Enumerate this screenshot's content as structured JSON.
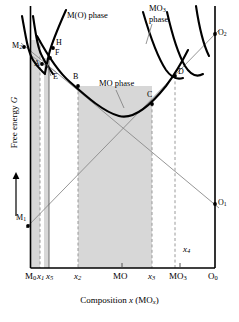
{
  "figure": {
    "type": "free-energy-composition-diagram",
    "axes": {
      "ylabel": "Free energy",
      "ylabel_symbol": "G",
      "xlabel_prefix": "Composition ",
      "xlabel_symbol": "x",
      "xlabel_suffix": " (MO",
      "xlabel_suffix_sub": "x",
      "xlabel_close": ")",
      "y_arrow": "up"
    },
    "x_ticks": [
      {
        "id": "t-M0",
        "base": "M",
        "sub": "0",
        "x": 30.5
      },
      {
        "id": "t-x1",
        "base": "x",
        "sub": "1",
        "x": 40.0,
        "italic": true
      },
      {
        "id": "t-x5",
        "base": "x",
        "sub": "5",
        "x": 49.0,
        "italic": true
      },
      {
        "id": "t-x2",
        "base": "x",
        "sub": "2",
        "x": 78.0,
        "italic": true
      },
      {
        "id": "t-MO",
        "base": "MO",
        "sub": "",
        "x": 122.0
      },
      {
        "id": "t-x3",
        "base": "x",
        "sub": "3",
        "x": 152.0,
        "italic": true
      },
      {
        "id": "t-MO3",
        "base": "MO",
        "sub": "3",
        "x": 180.0
      },
      {
        "id": "t-O0",
        "base": "O",
        "sub": "0",
        "x": 215.0
      }
    ],
    "inner_labels": [
      {
        "id": "x4",
        "base": "x",
        "sub": "4",
        "x": 186,
        "y": 250,
        "italic": true
      }
    ],
    "points": [
      {
        "id": "M2",
        "base": "M",
        "sub": "2",
        "x": 24.0,
        "y": 47.0,
        "lx": 12,
        "ly": 42
      },
      {
        "id": "M1",
        "base": "M",
        "sub": "1",
        "x": 30.5,
        "y": 224.0,
        "lx": 18,
        "ly": 213
      },
      {
        "id": "O2",
        "base": "O",
        "sub": "2",
        "x": 215.0,
        "y": 34.0,
        "lx": 219,
        "ly": 30
      },
      {
        "id": "O1",
        "base": "O",
        "sub": "1",
        "x": 215.0,
        "y": 204.0,
        "lx": 219,
        "ly": 199
      },
      {
        "id": "A",
        "base": "A",
        "sub": "",
        "x": 43.0,
        "y": 63.0,
        "lx": 35,
        "ly": 63
      },
      {
        "id": "H",
        "base": "H",
        "sub": "",
        "x": 53.5,
        "y": 48.0,
        "lx": 57,
        "ly": 43
      },
      {
        "id": "F",
        "base": "F",
        "sub": "",
        "x": 51.0,
        "y": 56.0,
        "lx": 55,
        "ly": 53
      },
      {
        "id": "E",
        "base": "E",
        "sub": "",
        "x": 49.0,
        "y": 78.0,
        "lx": 53,
        "ly": 78
      },
      {
        "id": "B",
        "base": "B",
        "sub": "",
        "x": 78.0,
        "y": 86.0,
        "lx": 74,
        "ly": 77
      },
      {
        "id": "C",
        "base": "C",
        "sub": "",
        "x": 152.0,
        "y": 104.0,
        "lx": 147,
        "ly": 95
      },
      {
        "id": "D",
        "base": "D",
        "sub": "",
        "x": 175.0,
        "y": 76.0,
        "lx": 179,
        "ly": 73
      }
    ],
    "phase_labels": [
      {
        "id": "MO-phase",
        "base": "MO",
        "sub": "",
        "text2": " phase",
        "x": 101,
        "y": 83,
        "leader": [
          [
            116,
            90
          ],
          [
            121,
            105
          ]
        ]
      },
      {
        "id": "M(O)-phase",
        "base": "M(O)",
        "sub": "",
        "text2": " phase",
        "x": 67,
        "y": 14,
        "leader": null
      },
      {
        "id": "MO3-phase",
        "base": "MO",
        "sub": "3",
        "text2": "phase",
        "x": 150,
        "y": 8,
        "leader": [
          [
            153,
            25
          ],
          [
            148,
            42
          ]
        ]
      }
    ],
    "colors": {
      "curve": "#000000",
      "tangent": "#808080",
      "shade": "#d7d7d7",
      "axis": "#000000",
      "dashed": "#9a9a9a",
      "background": "#ffffff"
    },
    "shaded_bands": [
      {
        "id": "band-M0-x1",
        "x0": 30.5,
        "x1": 40.0
      },
      {
        "id": "band-x5-edge",
        "x0": 44.0,
        "x1": 49.0
      },
      {
        "id": "band-x2-x3",
        "x0": 78.0,
        "x1": 152.0
      }
    ]
  }
}
